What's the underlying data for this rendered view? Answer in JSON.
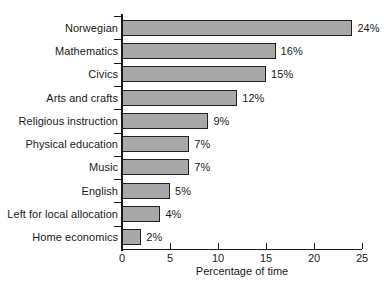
{
  "chart_data": {
    "type": "bar",
    "orientation": "horizontal",
    "title": "",
    "xlabel": "Percentage of time",
    "ylabel": "",
    "categories": [
      "Norwegian",
      "Mathematics",
      "Civics",
      "Arts and crafts",
      "Religious instruction",
      "Physical education",
      "Music",
      "English",
      "Left for local allocation",
      "Home economics"
    ],
    "values": [
      24,
      16,
      15,
      12,
      9,
      7,
      7,
      5,
      4,
      2
    ],
    "data_labels": [
      "24%",
      "16%",
      "15%",
      "12%",
      "9%",
      "7%",
      "7%",
      "5%",
      "4%",
      "2%"
    ],
    "xlim": [
      0,
      25
    ],
    "xticks": [
      0,
      5,
      10,
      15,
      20,
      25
    ],
    "xtick_labels": [
      "0",
      "5",
      "10",
      "15",
      "20",
      "25"
    ],
    "grid": false,
    "legend": false,
    "bar_fill_color": "#a8a8a8",
    "bar_edge_color": "#222222",
    "background_color": "#ffffff",
    "text_color": "#1a1a1a"
  }
}
